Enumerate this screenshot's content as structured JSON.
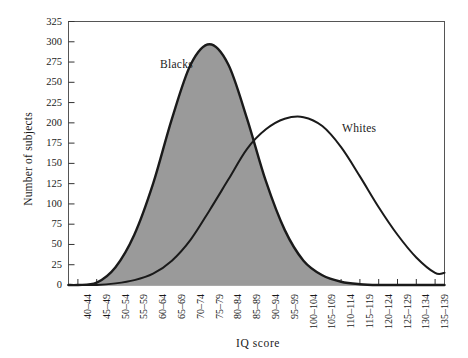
{
  "chart_data": {
    "type": "line",
    "title": "",
    "xlabel": "IQ score",
    "ylabel": "Number of subjects",
    "ylim": [
      0,
      325
    ],
    "ytick_step": 25,
    "yticks": [
      0,
      25,
      50,
      75,
      100,
      125,
      150,
      175,
      200,
      225,
      250,
      275,
      300,
      325
    ],
    "grid": false,
    "legend_position": "inline-annotations",
    "categories": [
      "40–44",
      "45–49",
      "50–54",
      "55–59",
      "60–64",
      "65–69",
      "70–74",
      "75–79",
      "80–84",
      "85–89",
      "90–94",
      "95–99",
      "100–104",
      "105–109",
      "110–114",
      "115–119",
      "120–124",
      "125–129",
      "130–134",
      "135–139"
    ],
    "series": [
      {
        "name": "Blacks",
        "style": "filled-gray",
        "fill_color": "#9a9a9a",
        "line_color": "#1a1a1a",
        "values": [
          0,
          3,
          22,
          62,
          125,
          205,
          272,
          297,
          272,
          205,
          128,
          68,
          30,
          12,
          4,
          1,
          0,
          0,
          0,
          0
        ]
      },
      {
        "name": "Whites",
        "style": "outline",
        "fill_color": "none",
        "line_color": "#1a1a1a",
        "values": [
          0,
          0,
          2,
          6,
          14,
          30,
          56,
          92,
          130,
          168,
          192,
          205,
          207,
          196,
          170,
          134,
          96,
          62,
          34,
          15
        ]
      }
    ],
    "annotations": [
      {
        "text": "Blacks",
        "series": "Blacks"
      },
      {
        "text": "Whites",
        "series": "Whites"
      }
    ]
  },
  "axes": {
    "y_title": "Number of subjects",
    "x_title": "IQ score"
  },
  "colors": {
    "fill_gray": "#9a9a9a",
    "line_black": "#1a1a1a",
    "background": "#ffffff",
    "frame": "#555555"
  }
}
